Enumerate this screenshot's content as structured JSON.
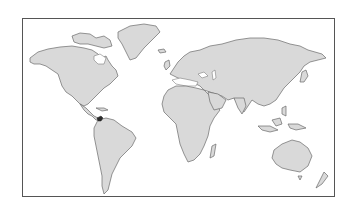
{
  "map": {
    "type": "world-outline-map",
    "projection": "equirectangular-style",
    "land_color": "#d9d9d9",
    "outline_color": "#6a6a6a",
    "frame_color": "#555555",
    "background_color": "#ffffff",
    "highlighted_region": {
      "name": "Panama",
      "color": "#2a2a2a"
    },
    "continents": [
      "North America",
      "Greenland",
      "South America",
      "Europe",
      "Africa",
      "Asia",
      "Australia",
      "New Zealand"
    ]
  }
}
